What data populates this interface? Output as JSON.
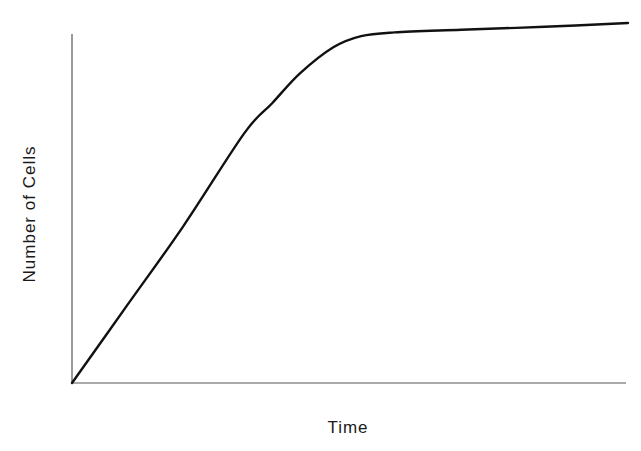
{
  "chart_data": {
    "type": "line",
    "title": "",
    "xlabel": "Time",
    "ylabel": "Number of Cells",
    "x_ticks": [],
    "y_ticks": [],
    "grid": false,
    "legend": null,
    "xlim": [
      0,
      1
    ],
    "ylim": [
      0,
      1
    ],
    "series": [
      {
        "name": "cell growth",
        "description": "Linear increase from origin, decelerating into a plateau (near-saturation) for the remainder of time",
        "x": [
          0.0,
          0.1,
          0.2,
          0.31,
          0.36,
          0.41,
          0.47,
          0.52,
          0.58,
          0.7,
          0.85,
          1.0
        ],
        "y": [
          0.0,
          0.21,
          0.42,
          0.67,
          0.75,
          0.83,
          0.9,
          0.93,
          0.94,
          0.947,
          0.955,
          0.965
        ]
      }
    ]
  },
  "colors": {
    "axis": "#555555",
    "line": "#111111",
    "text": "#1a1a1a",
    "background": "#ffffff"
  }
}
